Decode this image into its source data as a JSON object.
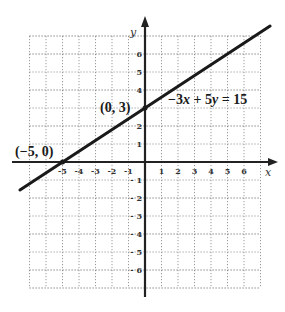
{
  "chart_data": {
    "type": "line",
    "title": "",
    "xlabel": "x",
    "ylabel": "y",
    "xlim": [
      -7,
      7
    ],
    "ylim": [
      -7,
      7
    ],
    "grid": true,
    "x_ticks": [
      -5,
      -4,
      -3,
      -2,
      -1,
      1,
      2,
      3,
      4,
      5,
      6
    ],
    "y_ticks": [
      6,
      5,
      4,
      2,
      1,
      -1,
      -2,
      -3,
      -4,
      -5,
      -6
    ],
    "series": [
      {
        "name": "-3x + 5y = 15",
        "equation": "-3x + 5y = 15",
        "slope": 0.6,
        "intercept": 3,
        "x": [
          -7.58,
          -5,
          0,
          7.58
        ],
        "y": [
          -1.55,
          0,
          3,
          7.55
        ]
      }
    ],
    "annotations": [
      {
        "text": "(0, 3)",
        "x": 0,
        "y": 3
      },
      {
        "text": "(−5, 0)",
        "x": -5,
        "y": 0
      },
      {
        "text": "−3x + 5y = 15",
        "x": 1.3,
        "y": 3.7
      }
    ]
  },
  "labels": {
    "x_axis": "x",
    "y_axis": "y",
    "point_y_intercept": "(0, 3)",
    "point_x_intercept": "(−5, 0)",
    "eq_prefix": "−3",
    "eq_x": "x",
    "eq_mid": " + 5",
    "eq_y": "y",
    "eq_suffix": " = 15"
  },
  "colors": {
    "line": "#1a1a1a",
    "axis": "#222222",
    "grid": "#9a9a9a",
    "background": "#ffffff"
  }
}
